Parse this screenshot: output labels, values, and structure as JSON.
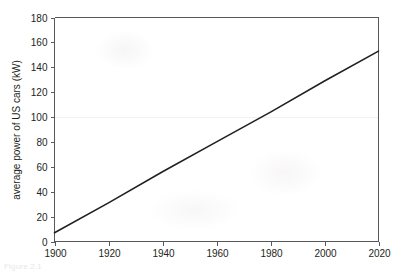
{
  "figure": {
    "caption": "Figure 2.1",
    "alt_name": "line-chart-average-power-us-cars"
  },
  "chart_data": {
    "type": "line",
    "title": "",
    "xlabel": "",
    "ylabel": "average power of US cars  (kW)",
    "xlim": [
      1900,
      2020
    ],
    "ylim": [
      0,
      180
    ],
    "grid": false,
    "legend": null,
    "xticks": [
      "1900",
      "1920",
      "1940",
      "1960",
      "1980",
      "2000",
      "2020"
    ],
    "xtick_values": [
      1900,
      1920,
      1940,
      1960,
      1980,
      2000,
      2020
    ],
    "yticks": [
      "0",
      "20",
      "40",
      "60",
      "80",
      "100",
      "120",
      "140",
      "160",
      "180"
    ],
    "ytick_values": [
      0,
      20,
      40,
      60,
      80,
      100,
      120,
      140,
      160,
      180
    ],
    "series": [
      {
        "name": "average power of US cars",
        "color": "#231f20",
        "x": [
          1900,
          1920,
          1940,
          1960,
          1980,
          2000,
          2020
        ],
        "values": [
          7,
          31,
          56,
          80,
          104,
          129,
          153
        ]
      }
    ]
  },
  "colors": {
    "axis": "#58595b",
    "line": "#231f20",
    "text": "#231f20",
    "background": "#ffffff"
  }
}
